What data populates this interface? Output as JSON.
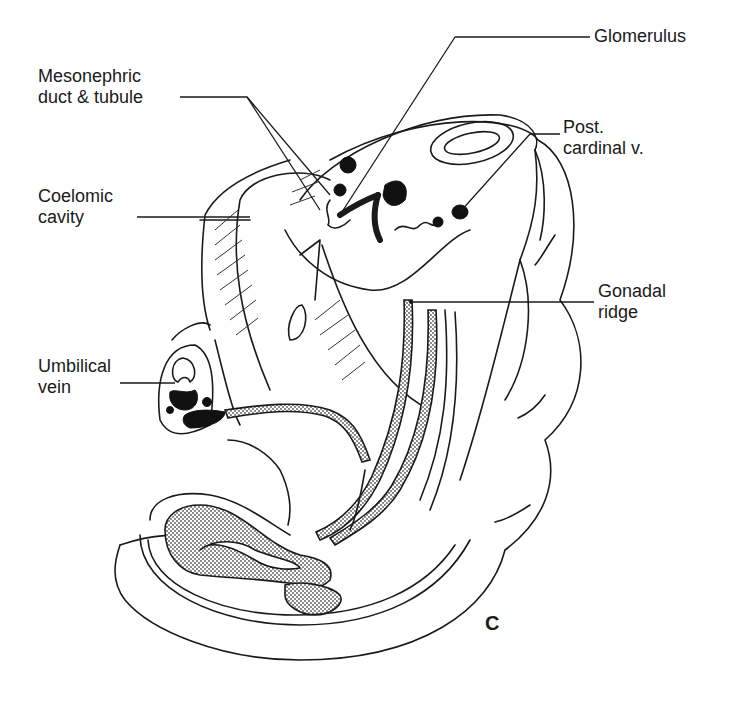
{
  "figure": {
    "panel_letter": "C",
    "labels": {
      "glomerulus": {
        "line1": "Glomerulus"
      },
      "mesonephric": {
        "line1": "Mesonephric",
        "line2": "duct & tubule"
      },
      "post_cardinal": {
        "line1": "Post.",
        "line2": "cardinal v."
      },
      "coelomic": {
        "line1": "Coelomic",
        "line2": "cavity"
      },
      "gonadal": {
        "line1": "Gonadal",
        "line2": "ridge"
      },
      "umbilical": {
        "line1": "Umbilical",
        "line2": "vein"
      }
    }
  }
}
